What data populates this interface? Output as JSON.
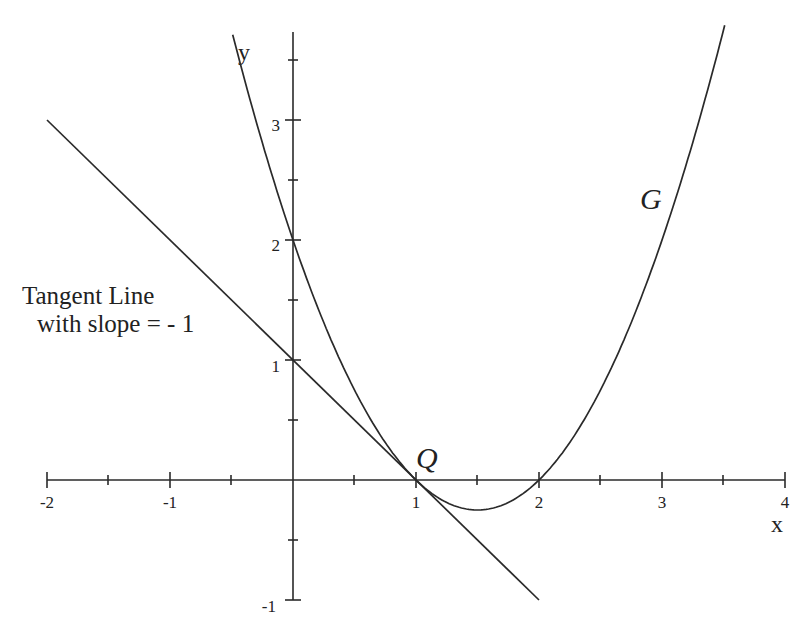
{
  "chart_data": {
    "type": "line",
    "title": "",
    "xlabel": "x",
    "ylabel": "y",
    "xlim": [
      -2,
      4
    ],
    "ylim": [
      -1,
      3.75
    ],
    "grid": false,
    "x_ticks": [
      -2,
      -1,
      1,
      2,
      3,
      4
    ],
    "x_minor_ticks": [
      -1.5,
      -0.5,
      0.5,
      1.5,
      2.5,
      3.5
    ],
    "y_ticks": [
      -1,
      1,
      2,
      3
    ],
    "y_minor_ticks": [
      -0.5,
      0.5,
      1.5,
      2.5,
      3.5
    ],
    "series": [
      {
        "name": "G",
        "equation": "y = x^2 - 3x + 2",
        "x": [
          -0.49,
          0,
          0.5,
          1,
          1.5,
          2,
          2.5,
          3,
          3.5
        ],
        "values": [
          3.71,
          2,
          0.75,
          0,
          -0.25,
          0,
          0.75,
          2,
          3.75
        ]
      },
      {
        "name": "Tangent Line",
        "equation": "y = -x + 1",
        "x": [
          -2,
          2
        ],
        "values": [
          3,
          -1
        ]
      }
    ],
    "points": [
      {
        "label": "Q",
        "x": 1,
        "y": 0
      }
    ],
    "annotations": [
      {
        "text": "Tangent Line",
        "position": "left, y≈1.5"
      },
      {
        "text": "with slope = - 1",
        "position": "left, y≈1.15"
      },
      {
        "text": "G",
        "position": "near (2.8, 2.3)"
      },
      {
        "text": "Q",
        "position": "at (1, 0)"
      }
    ]
  },
  "labels": {
    "x_axis": "x",
    "y_axis": "y",
    "curve": "G",
    "point": "Q",
    "tangent_line_1": "Tangent Line",
    "tangent_line_2": "with slope = - 1",
    "x_tick_labels": [
      "-2",
      "-1",
      "1",
      "2",
      "3",
      "4"
    ],
    "y_tick_labels": [
      "-1",
      "1",
      "2",
      "3"
    ]
  },
  "colors": {
    "ink": "#2a2a2a",
    "background": "#ffffff"
  }
}
